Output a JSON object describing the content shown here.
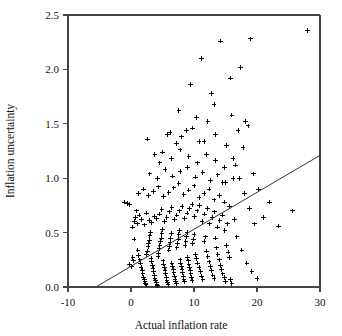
{
  "chart_data": {
    "type": "scatter",
    "title": "",
    "xlabel": "Actual inflation rate",
    "ylabel": "Inflation uncertainty",
    "xlim": [
      -10,
      30
    ],
    "ylim": [
      0.0,
      2.5
    ],
    "xticks": [
      -10,
      0,
      10,
      20,
      30
    ],
    "xticklabels": [
      "-10",
      "0",
      "10",
      "20",
      "30"
    ],
    "yticks": [
      0.0,
      0.5,
      1.0,
      1.5,
      2.0,
      2.5
    ],
    "yticklabels": [
      "0.0",
      "0.5",
      "1.0",
      "1.5",
      "2.0",
      "2.5"
    ],
    "grid": false,
    "legend": null,
    "marker": "plus",
    "marker_color": "#000000",
    "frame_color": "#444444",
    "fit_line": {
      "type": "line",
      "label": "regression fit",
      "x": [
        -5.6,
        30.0
      ],
      "y": [
        0.0,
        1.21
      ],
      "slope": 0.034,
      "intercept": 0.19,
      "color": "#333333"
    },
    "points": [
      [
        -1.0,
        0.78
      ],
      [
        -0.6,
        0.77
      ],
      [
        -0.2,
        0.76
      ],
      [
        0.3,
        0.27
      ],
      [
        0.4,
        0.24
      ],
      [
        -0.2,
        0.21
      ],
      [
        0.1,
        0.19
      ],
      [
        0.5,
        0.44
      ],
      [
        0.7,
        0.64
      ],
      [
        0.9,
        0.7
      ],
      [
        1.1,
        0.34
      ],
      [
        1.2,
        0.29
      ],
      [
        1.4,
        0.25
      ],
      [
        1.5,
        0.22
      ],
      [
        1.6,
        0.18
      ],
      [
        1.8,
        0.15
      ],
      [
        1.9,
        0.12
      ],
      [
        2.0,
        0.09
      ],
      [
        2.1,
        0.07
      ],
      [
        2.2,
        0.05
      ],
      [
        2.3,
        0.03
      ],
      [
        2.4,
        0.02
      ],
      [
        2.5,
        0.3
      ],
      [
        2.6,
        0.33
      ],
      [
        2.7,
        0.37
      ],
      [
        2.8,
        0.4
      ],
      [
        2.9,
        0.43
      ],
      [
        3.0,
        0.47
      ],
      [
        3.1,
        0.5
      ],
      [
        3.2,
        0.26
      ],
      [
        3.3,
        0.23
      ],
      [
        3.4,
        0.2
      ],
      [
        3.5,
        0.17
      ],
      [
        3.6,
        0.14
      ],
      [
        3.7,
        0.11
      ],
      [
        3.8,
        0.08
      ],
      [
        3.9,
        0.06
      ],
      [
        4.0,
        0.04
      ],
      [
        4.1,
        0.02
      ],
      [
        4.2,
        0.01
      ],
      [
        4.3,
        0.28
      ],
      [
        4.4,
        0.31
      ],
      [
        4.5,
        0.35
      ],
      [
        4.6,
        0.38
      ],
      [
        4.7,
        0.42
      ],
      [
        4.8,
        0.45
      ],
      [
        4.9,
        0.49
      ],
      [
        5.0,
        0.53
      ],
      [
        5.1,
        0.24
      ],
      [
        5.2,
        0.21
      ],
      [
        5.3,
        0.18
      ],
      [
        5.4,
        0.15
      ],
      [
        5.5,
        0.12
      ],
      [
        5.6,
        0.09
      ],
      [
        5.7,
        0.06
      ],
      [
        5.8,
        0.04
      ],
      [
        5.9,
        0.02
      ],
      [
        6.0,
        0.34
      ],
      [
        6.1,
        0.37
      ],
      [
        6.2,
        0.41
      ],
      [
        6.3,
        0.45
      ],
      [
        6.4,
        0.49
      ],
      [
        6.5,
        0.22
      ],
      [
        6.6,
        0.19
      ],
      [
        6.7,
        0.16
      ],
      [
        6.8,
        0.13
      ],
      [
        6.9,
        0.1
      ],
      [
        7.0,
        0.07
      ],
      [
        7.1,
        0.05
      ],
      [
        7.2,
        0.03
      ],
      [
        7.3,
        0.36
      ],
      [
        7.4,
        0.4
      ],
      [
        7.5,
        0.44
      ],
      [
        7.6,
        0.48
      ],
      [
        7.7,
        0.52
      ],
      [
        7.8,
        0.25
      ],
      [
        7.9,
        0.22
      ],
      [
        8.0,
        0.19
      ],
      [
        8.1,
        0.16
      ],
      [
        8.2,
        0.13
      ],
      [
        8.3,
        0.1
      ],
      [
        8.4,
        0.07
      ],
      [
        8.5,
        0.05
      ],
      [
        8.6,
        0.38
      ],
      [
        8.7,
        0.42
      ],
      [
        8.8,
        0.46
      ],
      [
        8.9,
        0.5
      ],
      [
        9.0,
        0.27
      ],
      [
        9.1,
        0.24
      ],
      [
        9.2,
        0.21
      ],
      [
        9.3,
        0.18
      ],
      [
        9.4,
        0.15
      ],
      [
        9.5,
        0.12
      ],
      [
        9.6,
        0.09
      ],
      [
        9.7,
        0.06
      ],
      [
        9.8,
        0.4
      ],
      [
        9.9,
        0.44
      ],
      [
        10.0,
        0.48
      ],
      [
        10.2,
        0.3
      ],
      [
        10.4,
        0.26
      ],
      [
        10.6,
        0.22
      ],
      [
        10.8,
        0.18
      ],
      [
        11.0,
        0.14
      ],
      [
        11.2,
        0.1
      ],
      [
        11.4,
        0.07
      ],
      [
        11.6,
        0.42
      ],
      [
        11.8,
        0.46
      ],
      [
        12.0,
        0.33
      ],
      [
        12.2,
        0.28
      ],
      [
        12.4,
        0.23
      ],
      [
        12.6,
        0.19
      ],
      [
        12.8,
        0.15
      ],
      [
        13.0,
        0.11
      ],
      [
        13.2,
        0.08
      ],
      [
        13.4,
        0.45
      ],
      [
        13.6,
        0.36
      ],
      [
        13.8,
        0.3
      ],
      [
        14.0,
        0.25
      ],
      [
        14.2,
        0.2
      ],
      [
        14.4,
        0.16
      ],
      [
        14.6,
        0.12
      ],
      [
        14.8,
        0.09
      ],
      [
        15.0,
        0.05
      ],
      [
        15.2,
        0.38
      ],
      [
        15.4,
        0.32
      ],
      [
        15.6,
        0.27
      ],
      [
        15.8,
        0.07
      ],
      [
        16.0,
        0.03
      ],
      [
        0.2,
        0.55
      ],
      [
        0.6,
        0.6
      ],
      [
        1.0,
        0.58
      ],
      [
        1.3,
        0.66
      ],
      [
        1.7,
        0.62
      ],
      [
        2.1,
        0.57
      ],
      [
        2.5,
        0.68
      ],
      [
        2.9,
        0.61
      ],
      [
        3.3,
        0.59
      ],
      [
        3.7,
        0.65
      ],
      [
        4.1,
        0.63
      ],
      [
        4.5,
        0.67
      ],
      [
        4.9,
        0.71
      ],
      [
        5.3,
        0.6
      ],
      [
        5.7,
        0.64
      ],
      [
        6.1,
        0.69
      ],
      [
        6.5,
        0.73
      ],
      [
        6.9,
        0.62
      ],
      [
        7.3,
        0.66
      ],
      [
        7.7,
        0.7
      ],
      [
        8.1,
        0.74
      ],
      [
        8.5,
        0.63
      ],
      [
        8.9,
        0.68
      ],
      [
        9.3,
        0.72
      ],
      [
        9.7,
        0.76
      ],
      [
        10.1,
        0.65
      ],
      [
        10.5,
        0.7
      ],
      [
        10.9,
        0.75
      ],
      [
        11.3,
        0.6
      ],
      [
        11.7,
        0.67
      ],
      [
        12.1,
        0.72
      ],
      [
        12.5,
        0.58
      ],
      [
        12.9,
        0.64
      ],
      [
        13.3,
        0.69
      ],
      [
        13.7,
        0.55
      ],
      [
        14.1,
        0.61
      ],
      [
        14.5,
        0.66
      ],
      [
        14.9,
        0.52
      ],
      [
        15.3,
        0.58
      ],
      [
        1.2,
        0.86
      ],
      [
        2.0,
        0.9
      ],
      [
        2.8,
        0.84
      ],
      [
        3.6,
        0.88
      ],
      [
        4.4,
        0.92
      ],
      [
        5.2,
        0.83
      ],
      [
        6.0,
        0.87
      ],
      [
        6.8,
        0.91
      ],
      [
        7.6,
        0.95
      ],
      [
        8.4,
        0.85
      ],
      [
        9.2,
        0.89
      ],
      [
        10.0,
        0.93
      ],
      [
        10.8,
        0.82
      ],
      [
        11.6,
        0.86
      ],
      [
        12.4,
        0.9
      ],
      [
        13.2,
        0.8
      ],
      [
        14.0,
        0.84
      ],
      [
        14.8,
        0.78
      ],
      [
        3.0,
        1.04
      ],
      [
        4.2,
        1.0
      ],
      [
        5.4,
        1.08
      ],
      [
        6.6,
        1.02
      ],
      [
        7.8,
        1.06
      ],
      [
        9.0,
        1.1
      ],
      [
        10.2,
        1.01
      ],
      [
        11.4,
        1.05
      ],
      [
        12.6,
        0.98
      ],
      [
        13.8,
        1.03
      ],
      [
        15.0,
        0.96
      ],
      [
        16.2,
        1.0
      ],
      [
        5.0,
        1.24
      ],
      [
        6.4,
        1.18
      ],
      [
        7.8,
        1.26
      ],
      [
        9.2,
        1.2
      ],
      [
        10.6,
        1.14
      ],
      [
        12.0,
        1.22
      ],
      [
        13.4,
        1.16
      ],
      [
        14.8,
        1.1
      ],
      [
        16.2,
        1.18
      ],
      [
        6.2,
        1.42
      ],
      [
        8.0,
        1.38
      ],
      [
        9.8,
        1.46
      ],
      [
        11.6,
        1.34
      ],
      [
        13.4,
        1.4
      ],
      [
        15.2,
        1.3
      ],
      [
        17.0,
        1.44
      ],
      [
        18.6,
        1.48
      ],
      [
        7.6,
        1.62
      ],
      [
        10.4,
        1.56
      ],
      [
        13.2,
        1.68
      ],
      [
        16.0,
        1.58
      ],
      [
        18.2,
        1.52
      ],
      [
        9.4,
        1.86
      ],
      [
        12.8,
        1.78
      ],
      [
        15.8,
        1.92
      ],
      [
        11.2,
        2.1
      ],
      [
        14.2,
        2.26
      ],
      [
        17.4,
        2.02
      ],
      [
        19.0,
        2.28
      ],
      [
        28.0,
        2.36
      ],
      [
        17.2,
        1.0
      ],
      [
        18.0,
        0.86
      ],
      [
        18.8,
        0.72
      ],
      [
        19.6,
        0.58
      ],
      [
        20.2,
        0.9
      ],
      [
        21.0,
        0.64
      ],
      [
        22.0,
        0.78
      ],
      [
        23.4,
        0.56
      ],
      [
        25.6,
        0.7
      ],
      [
        16.8,
        0.46
      ],
      [
        17.6,
        0.34
      ],
      [
        18.4,
        0.22
      ],
      [
        19.2,
        0.14
      ],
      [
        20.0,
        0.08
      ],
      [
        16.4,
        0.62
      ],
      [
        15.6,
        0.74
      ],
      [
        14.6,
        0.96
      ],
      [
        16.6,
        1.12
      ],
      [
        17.8,
        1.28
      ],
      [
        19.4,
        1.04
      ],
      [
        12.2,
        1.52
      ],
      [
        10.8,
        1.34
      ],
      [
        8.8,
        1.44
      ],
      [
        7.2,
        1.32
      ],
      [
        5.8,
        1.4
      ],
      [
        4.6,
        1.14
      ],
      [
        3.8,
        1.22
      ],
      [
        2.6,
        1.36
      ]
    ]
  },
  "axis": {
    "x_title": "Actual inflation rate",
    "y_title": "Inflation uncertainty"
  }
}
